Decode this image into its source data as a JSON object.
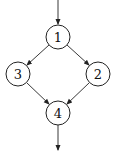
{
  "diagram": {
    "type": "control-flow-graph",
    "nodes": [
      {
        "id": "1",
        "label": "1",
        "cx": 58,
        "cy": 37,
        "r": 12
      },
      {
        "id": "3",
        "label": "3",
        "cx": 18,
        "cy": 74,
        "r": 12
      },
      {
        "id": "2",
        "label": "2",
        "cx": 98,
        "cy": 74,
        "r": 12
      },
      {
        "id": "4",
        "label": "4",
        "cx": 58,
        "cy": 113,
        "r": 12
      }
    ],
    "edges": [
      {
        "from": "entry",
        "to": "1"
      },
      {
        "from": "1",
        "to": "3"
      },
      {
        "from": "1",
        "to": "2"
      },
      {
        "from": "3",
        "to": "4"
      },
      {
        "from": "2",
        "to": "4"
      },
      {
        "from": "4",
        "to": "exit"
      }
    ],
    "colors": {
      "stroke": "#222222",
      "background": "#ffffff",
      "text": "#111111"
    }
  }
}
